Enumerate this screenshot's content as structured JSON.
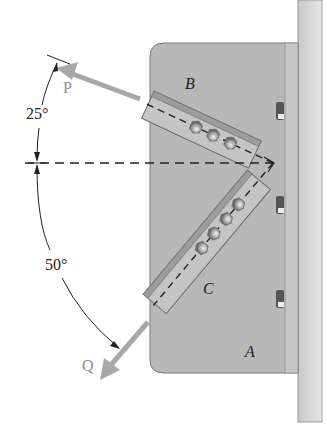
{
  "figure": {
    "labels": {
      "force_p": "P",
      "force_q": "Q",
      "member_b": "B",
      "member_c": "C",
      "plate_a": "A"
    },
    "angles": {
      "upper": "25°",
      "lower": "50°"
    },
    "colors": {
      "plate": "#b5b5b5",
      "wall": "#d6d6d6",
      "member": "#c4c4c4",
      "member_flange": "#9a9a9a",
      "force_arrow": "#a8a8a8",
      "force_label": "#8c8c8c",
      "line": "#222222"
    }
  }
}
